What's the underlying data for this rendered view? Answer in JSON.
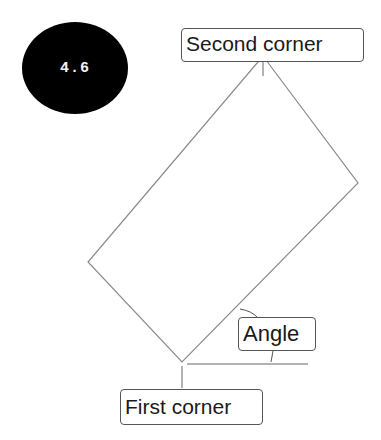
{
  "badge": {
    "number": "4.6",
    "color": "#000000"
  },
  "labels": {
    "second_corner": "Second corner",
    "first_corner": "First corner",
    "angle": "Angle"
  },
  "shape": {
    "type": "rotated-rectangle",
    "vertices": {
      "top": [
        263,
        56
      ],
      "right": [
        358,
        183
      ],
      "bottom": [
        182,
        362
      ],
      "left": [
        88,
        262
      ]
    },
    "stroke_color": "#888888"
  }
}
